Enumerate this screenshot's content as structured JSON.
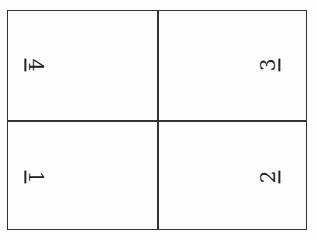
{
  "diagram": {
    "type": "2x2 grid",
    "cells": [
      {
        "position": "top-left",
        "label": "4",
        "orientation": "rotated-90-clockwise"
      },
      {
        "position": "top-right",
        "label": "3",
        "orientation": "rotated-90-counterclockwise"
      },
      {
        "position": "bottom-left",
        "label": "1",
        "orientation": "rotated-90-clockwise"
      },
      {
        "position": "bottom-right",
        "label": "2",
        "orientation": "rotated-90-counterclockwise"
      }
    ],
    "colors": {
      "line": "#333333",
      "text": "#222222",
      "background": "#fdfdfd"
    }
  }
}
